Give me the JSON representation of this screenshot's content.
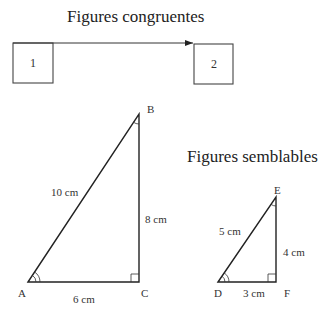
{
  "congruent": {
    "title": "Figures congruentes",
    "box1_label": "1",
    "box2_label": "2",
    "arrow": "translation-arrow"
  },
  "similar": {
    "title": "Figures semblables"
  },
  "triangle_large": {
    "vertices": {
      "A": "A",
      "B": "B",
      "C": "C"
    },
    "sides": {
      "hypotenuse": "10 cm",
      "vertical": "8 cm",
      "base": "6 cm"
    }
  },
  "triangle_small": {
    "vertices": {
      "D": "D",
      "E": "E",
      "F": "F"
    },
    "sides": {
      "hypotenuse": "5 cm",
      "vertical": "4 cm",
      "base": "3 cm"
    }
  }
}
